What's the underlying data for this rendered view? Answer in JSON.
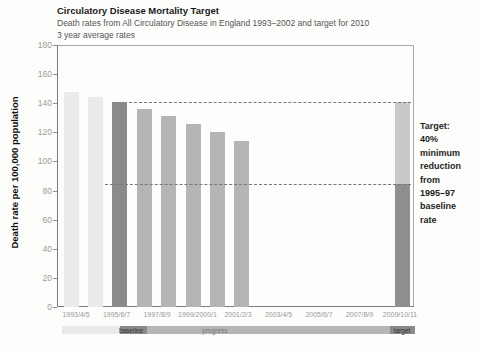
{
  "header": {
    "title": "Circulatory Disease Mortality Target",
    "subtitle": "Death rates from All Circulatory Disease in England 1993–2002 and target for 2010",
    "subtitle2": "3 year average rates"
  },
  "annotation": {
    "lines": [
      "Target:",
      "40%",
      "minimum",
      "reduction",
      "from",
      "1995–97",
      "baseline",
      "rate"
    ]
  },
  "colors": {
    "bar_pre": "#ebebeb",
    "bar_baseline": "#8a8a8a",
    "bar_progress": "#b5b5b5",
    "target_upper": "#c9c9c9",
    "target_lower": "#8f8f8f",
    "dashed_line": "#777777",
    "strip_pre": "#e9e9e9",
    "strip_dark": "#8a8a8a",
    "strip_progress": "#b5b5b5",
    "strip_label_dark_text": "#333333",
    "strip_label_progress_text": "#777777",
    "tick_text": "#9a9a9a",
    "title_text": "#1a1a1a",
    "subtitle_text": "#555555"
  },
  "chart_data": {
    "type": "bar",
    "title": "Circulatory Disease Mortality Target",
    "subtitle": "Death rates from All Circulatory Disease in England 1993–2002 and target for 2010",
    "note": "3 year average rates",
    "ylabel": "Death rate per 100,000 population",
    "xlabel": "",
    "ylim": [
      0,
      180
    ],
    "ytick_interval": 20,
    "grid": "off",
    "xtick_labels": [
      "1993/4/5",
      "1995/6/7",
      "1997/8/9",
      "1999/2000/1",
      "2001/2/3",
      "2003/4/5",
      "2005/6/7",
      "2007/8/9",
      "2009/10/11"
    ],
    "bars": [
      {
        "value": 148,
        "role": "pre"
      },
      {
        "value": 144,
        "role": "pre"
      },
      {
        "value": 141,
        "role": "baseline"
      },
      {
        "value": 136,
        "role": "progress"
      },
      {
        "value": 131,
        "role": "progress"
      },
      {
        "value": 126,
        "role": "progress"
      },
      {
        "value": 120,
        "role": "progress"
      },
      {
        "value": 114,
        "role": "progress"
      }
    ],
    "baseline_value": 141,
    "target_bar": {
      "xtick": "2009/10/11",
      "upper_value": 141,
      "target_value": 84.6
    },
    "dashed_lines": [
      141,
      84.6
    ],
    "legend_strip": [
      {
        "label": "",
        "role": "pre"
      },
      {
        "label": "baseline",
        "role": "dark"
      },
      {
        "label": "progress",
        "role": "progress"
      },
      {
        "label": "target",
        "role": "dark"
      }
    ],
    "annotation": "Target: 40% minimum reduction from 1995–97 baseline rate",
    "legend_position": "none"
  }
}
